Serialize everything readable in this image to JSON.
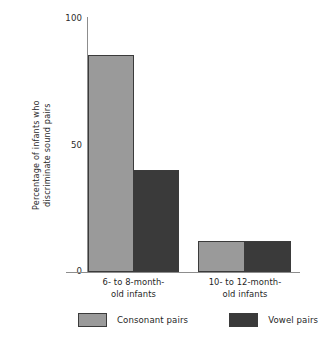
{
  "chart_data": {
    "type": "bar",
    "title": "",
    "subtitle": "",
    "xlabel": "",
    "ylabel_line1": "Percentage of infants who",
    "ylabel_line2": "discriminate sound pairs",
    "ylabel": "Percentage of infants who discriminate sound pairs",
    "categories": [
      "6- to 8-month-old infants",
      "10- to 12-month-old infants"
    ],
    "category_lines": [
      [
        "6- to 8-month-",
        "old infants"
      ],
      [
        "10- to 12-month-",
        "old infants"
      ]
    ],
    "series": [
      {
        "name": "Consonant pairs",
        "values": [
          85,
          12
        ],
        "color": "#9a9a9a"
      },
      {
        "name": "Vowel pairs",
        "values": [
          40,
          12
        ],
        "color": "#3a3a3a"
      }
    ],
    "ylim": [
      0,
      100
    ],
    "yticks": [
      0,
      50,
      100
    ],
    "ytick_labels": [
      "0",
      "50",
      "100"
    ],
    "grid": false,
    "legend_position": "bottom",
    "bar_edge_color": "#3b3b3b",
    "axis_color": "#8d8d8d"
  },
  "legend": {
    "items": [
      {
        "label": "Consonant pairs",
        "color": "#9a9a9a"
      },
      {
        "label": "Vowel pairs",
        "color": "#3a3a3a"
      }
    ]
  }
}
